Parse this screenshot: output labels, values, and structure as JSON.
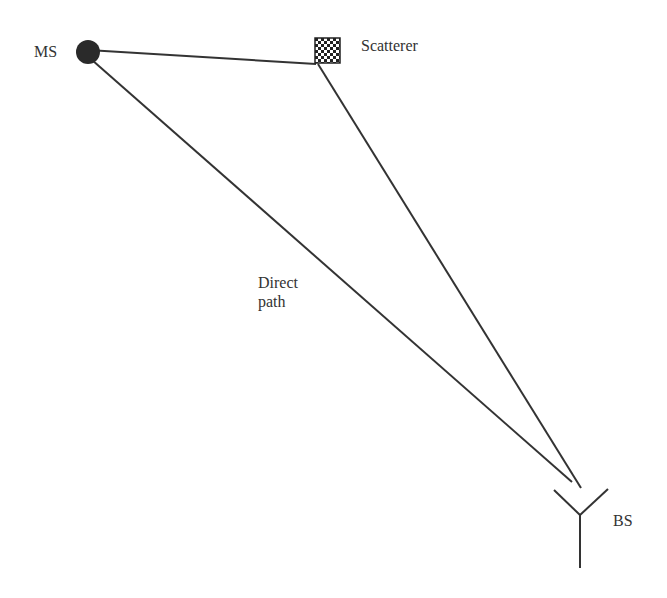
{
  "diagram": {
    "nodes": {
      "ms": {
        "label": "MS",
        "shape": "filled-circle"
      },
      "scatterer": {
        "label": "Scatterer",
        "shape": "checkered-square"
      },
      "bs": {
        "label": "BS",
        "shape": "antenna"
      }
    },
    "paths": {
      "direct_label_line1": "Direct",
      "direct_label_line2": "path"
    },
    "colors": {
      "line": "#333333",
      "fill": "#2a2a2a"
    }
  }
}
